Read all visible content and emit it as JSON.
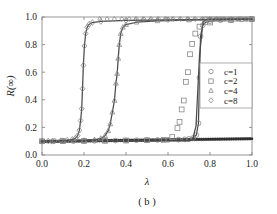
{
  "chart_data": {
    "type": "line",
    "title": "",
    "caption": "( b )",
    "xlabel": "λ",
    "ylabel": "R(∞)",
    "xlim": [
      0.0,
      1.0
    ],
    "ylim": [
      0.0,
      1.0
    ],
    "xticks": [
      "0.0",
      "0.2",
      "0.4",
      "0.6",
      "0.8",
      "1.0"
    ],
    "xtick_values": [
      0.0,
      0.2,
      0.4,
      0.6,
      0.8,
      1.0
    ],
    "yticks": [
      "0.0",
      "0.2",
      "0.4",
      "0.6",
      "0.8",
      "1.0"
    ],
    "ytick_values": [
      0.0,
      0.2,
      0.4,
      0.6,
      0.8,
      1.0
    ],
    "grid": false,
    "legend_position": "center-right",
    "legend": [
      {
        "label": "c=1",
        "marker": "circle"
      },
      {
        "label": "c=2",
        "marker": "square"
      },
      {
        "label": "c=4",
        "marker": "triangle"
      },
      {
        "label": "c=8",
        "marker": "diamond"
      }
    ],
    "series": [
      {
        "name": "c=1",
        "marker": "circle",
        "threshold": 0.75,
        "baseline": 0.1,
        "plateau": 0.985,
        "branch": "upper",
        "x": [
          0.0,
          0.05,
          0.1,
          0.15,
          0.2,
          0.25,
          0.3,
          0.35,
          0.4,
          0.45,
          0.5,
          0.55,
          0.6,
          0.65,
          0.68,
          0.7,
          0.72,
          0.735,
          0.745,
          0.75,
          0.755,
          0.765,
          0.78,
          0.8,
          0.85,
          0.9,
          0.95,
          1.0
        ],
        "y": [
          0.098,
          0.099,
          0.1,
          0.101,
          0.102,
          0.103,
          0.104,
          0.105,
          0.106,
          0.107,
          0.108,
          0.109,
          0.11,
          0.112,
          0.114,
          0.117,
          0.124,
          0.145,
          0.23,
          0.56,
          0.86,
          0.94,
          0.962,
          0.97,
          0.977,
          0.981,
          0.983,
          0.985
        ]
      },
      {
        "name": "c=2",
        "marker": "square",
        "threshold": 0.7,
        "baseline": 0.105,
        "plateau": 0.985,
        "branch": "upper-markers",
        "x": [
          0.0,
          0.1,
          0.2,
          0.3,
          0.4,
          0.5,
          0.58,
          0.62,
          0.645,
          0.655,
          0.665,
          0.675,
          0.685,
          0.695,
          0.705,
          0.715,
          0.73,
          0.75,
          0.8,
          0.9,
          1.0
        ],
        "y": [
          0.1,
          0.101,
          0.102,
          0.103,
          0.105,
          0.107,
          0.11,
          0.13,
          0.195,
          0.24,
          0.33,
          0.395,
          0.53,
          0.6,
          0.73,
          0.805,
          0.88,
          0.93,
          0.96,
          0.978,
          0.985
        ]
      },
      {
        "name": "c=4",
        "marker": "triangle",
        "threshold": 0.365,
        "baseline": 0.105,
        "plateau": 0.985,
        "branch": "upper",
        "x": [
          0.0,
          0.05,
          0.1,
          0.15,
          0.2,
          0.25,
          0.28,
          0.3,
          0.315,
          0.325,
          0.335,
          0.345,
          0.352,
          0.358,
          0.363,
          0.368,
          0.375,
          0.385,
          0.4,
          0.45,
          0.55,
          0.7,
          0.85,
          1.0
        ],
        "y": [
          0.1,
          0.101,
          0.102,
          0.103,
          0.105,
          0.11,
          0.12,
          0.14,
          0.175,
          0.225,
          0.31,
          0.395,
          0.52,
          0.59,
          0.7,
          0.8,
          0.88,
          0.925,
          0.945,
          0.962,
          0.972,
          0.978,
          0.982,
          0.985
        ]
      },
      {
        "name": "c=8",
        "marker": "diamond",
        "threshold": 0.195,
        "baseline": 0.105,
        "plateau": 0.985,
        "branch": "upper",
        "x": [
          0.0,
          0.03,
          0.06,
          0.09,
          0.12,
          0.145,
          0.16,
          0.17,
          0.178,
          0.184,
          0.189,
          0.193,
          0.197,
          0.202,
          0.208,
          0.215,
          0.225,
          0.24,
          0.28,
          0.4,
          0.6,
          0.8,
          1.0
        ],
        "y": [
          0.1,
          0.101,
          0.102,
          0.104,
          0.107,
          0.113,
          0.122,
          0.14,
          0.18,
          0.25,
          0.335,
          0.48,
          0.65,
          0.79,
          0.88,
          0.925,
          0.948,
          0.96,
          0.968,
          0.975,
          0.98,
          0.983,
          0.985
        ]
      },
      {
        "name": "lower-branch",
        "marker": "dense",
        "branch": "lower",
        "x": [
          0.0,
          0.1,
          0.2,
          0.3,
          0.4,
          0.5,
          0.6,
          0.7,
          0.8,
          0.9,
          1.0
        ],
        "y": [
          0.098,
          0.1,
          0.102,
          0.104,
          0.106,
          0.108,
          0.11,
          0.112,
          0.114,
          0.116,
          0.118
        ]
      }
    ]
  },
  "style": {
    "axis_color": "#8a8a8a",
    "curve_color": "#4a4a4a",
    "marker_color": "#888888",
    "baseline_color": "#2a2a2a",
    "legend_border": "#9a9a9a",
    "background": "#ffffff"
  }
}
